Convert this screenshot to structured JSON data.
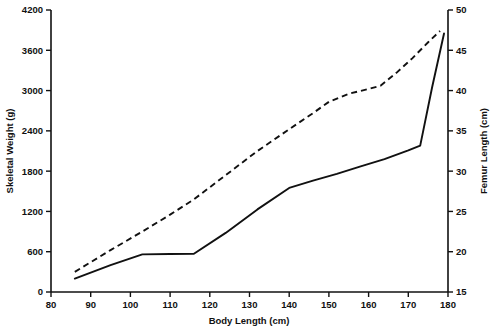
{
  "chart_data": {
    "type": "line",
    "title": "",
    "xlabel": "Body Length (cm)",
    "ylabel": "Skeletal Weight (g)",
    "y2label": "Femur Length (cm)",
    "xlim": [
      80,
      180
    ],
    "ylim": [
      0,
      4200
    ],
    "y2lim": [
      15,
      50
    ],
    "xticks": [
      80,
      90,
      100,
      110,
      120,
      130,
      140,
      150,
      160,
      170,
      180
    ],
    "yticks": [
      0,
      600,
      1200,
      1800,
      2400,
      3000,
      3600,
      4200
    ],
    "y2ticks": [
      15,
      20,
      25,
      30,
      35,
      40,
      45,
      50
    ],
    "xticklabels": [
      "80",
      "90",
      "100",
      "110",
      "120",
      "130",
      "140",
      "150",
      "160",
      "170",
      "180"
    ],
    "yticklabels": [
      "0",
      "600",
      "1200",
      "1800",
      "2400",
      "3000",
      "3600",
      "4200"
    ],
    "y2ticklabels": [
      "15",
      "20",
      "25",
      "30",
      "35",
      "40",
      "45",
      "50"
    ],
    "grid": false,
    "legend": "none",
    "series": [
      {
        "name": "Skeletal Weight",
        "axis": "left",
        "style": "solid",
        "x": [
          86,
          95,
          103,
          110,
          116,
          124,
          132,
          140,
          146,
          152,
          158,
          164,
          170,
          173,
          176,
          179
        ],
        "values": [
          200,
          400,
          560,
          565,
          570,
          880,
          1230,
          1550,
          1660,
          1760,
          1870,
          1980,
          2110,
          2180,
          3050,
          3850
        ]
      },
      {
        "name": "Femur Length",
        "axis": "right",
        "style": "dashed",
        "x": [
          86,
          95,
          103,
          110,
          116,
          124,
          132,
          140,
          146,
          150,
          155,
          160,
          163,
          167,
          171,
          175,
          178
        ],
        "values": [
          17.5,
          20.2,
          22.5,
          24.6,
          26.5,
          29.5,
          32.5,
          35.2,
          37.2,
          38.6,
          39.6,
          40.2,
          40.6,
          42.2,
          44.0,
          46.0,
          47.4
        ]
      }
    ]
  },
  "axes": {
    "x_title": "Body Length (cm)",
    "y_left_title": "Skeletal Weight (g)",
    "y_right_title": "Femur Length (cm)"
  },
  "colors": {
    "ink": "#111111",
    "background": "#ffffff"
  }
}
